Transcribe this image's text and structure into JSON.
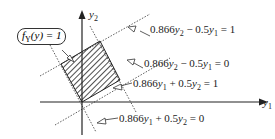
{
  "axes": {
    "x_label": "y",
    "x_sub": "1",
    "y_label": "y",
    "y_sub": "2"
  },
  "region_label": {
    "f": "f",
    "sub": "Y",
    "arg": "(y) = 1"
  },
  "lines": [
    {
      "coef1": "0.866",
      "v1": "y",
      "s1": "2",
      "op": " − 0.5",
      "v2": "y",
      "s2": "1",
      "rhs": " = 1"
    },
    {
      "coef1": "0.866",
      "v1": "y",
      "s1": "2",
      "op": " − 0.5",
      "v2": "y",
      "s2": "1",
      "rhs": " = 0"
    },
    {
      "coef1": "0.866",
      "v1": "y",
      "s1": "1",
      "op": " + 0.5",
      "v2": "y",
      "s2": "2",
      "rhs": " = 1"
    },
    {
      "coef1": "0.866",
      "v1": "y",
      "s1": "1",
      "op": " + 0.5",
      "v2": "y",
      "s2": "2",
      "rhs": " = 0"
    }
  ]
}
